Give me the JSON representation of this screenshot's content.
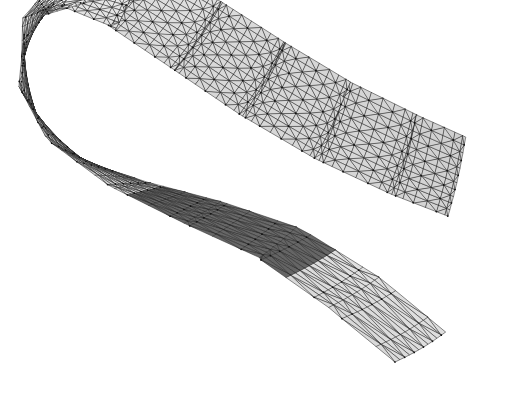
{
  "figure": {
    "kind": "3d-surface-mesh",
    "background_color": "#ffffff",
    "canvas": {
      "width": 525,
      "height": 394
    }
  },
  "render": {
    "mesh_edge_color": "#2b2b2b",
    "mesh_edge_width": 0.55,
    "vertex_dot_color": "#111111",
    "vertex_dot_radius": 0.85,
    "show_vertex_dots": true,
    "shading_model": "lambert-flat",
    "light_direction": [
      -0.35,
      -0.55,
      0.76
    ],
    "ambient": 0.42,
    "diffuse": 0.58,
    "face_fill_light": "#e8e8e8",
    "face_fill_mid": "#c2c2c2",
    "face_fill_dark": "#8f8f8f",
    "fold_fill_dark": "#585858",
    "fold_fill_darker": "#3f3f3f",
    "backface_darken": 0.46
  },
  "chart_data": {
    "type": "surface-mesh",
    "title": "Folded ribbon surface",
    "xlabel": "",
    "ylabel": "",
    "grid": false,
    "legend": "none",
    "mesh": {
      "u_divisions": 96,
      "v_divisions": 11,
      "triangulation": "alternating-diagonal",
      "u_range": [
        0,
        1
      ],
      "v_range": [
        -0.5,
        0.5
      ]
    },
    "spine_keypoints": [
      {
        "u": 0.0,
        "x": 470,
        "y": 205,
        "z": 42,
        "width": 74,
        "twist": 14,
        "tilt": -26
      },
      {
        "u": 0.07,
        "x": 420,
        "y": 188,
        "z": 50,
        "width": 78,
        "twist": 10,
        "tilt": -22
      },
      {
        "u": 0.16,
        "x": 352,
        "y": 160,
        "z": 60,
        "width": 82,
        "twist": 4,
        "tilt": -16
      },
      {
        "u": 0.26,
        "x": 286,
        "y": 126,
        "z": 72,
        "width": 86,
        "twist": -2,
        "tilt": -10
      },
      {
        "u": 0.36,
        "x": 224,
        "y": 90,
        "z": 84,
        "width": 88,
        "twist": -8,
        "tilt": -4
      },
      {
        "u": 0.46,
        "x": 160,
        "y": 54,
        "z": 92,
        "width": 88,
        "twist": -16,
        "tilt": 2
      },
      {
        "u": 0.55,
        "x": 104,
        "y": 40,
        "z": 90,
        "width": 86,
        "twist": -30,
        "tilt": 10
      },
      {
        "u": 0.62,
        "x": 64,
        "y": 62,
        "z": 82,
        "width": 84,
        "twist": -48,
        "tilt": 22
      },
      {
        "u": 0.68,
        "x": 44,
        "y": 102,
        "z": 70,
        "width": 82,
        "twist": -70,
        "tilt": 36
      },
      {
        "u": 0.74,
        "x": 50,
        "y": 146,
        "z": 56,
        "width": 82,
        "twist": -92,
        "tilt": 48
      },
      {
        "u": 0.79,
        "x": 84,
        "y": 180,
        "z": 44,
        "width": 84,
        "twist": -112,
        "tilt": 54
      },
      {
        "u": 0.84,
        "x": 142,
        "y": 206,
        "z": 34,
        "width": 86,
        "twist": -126,
        "tilt": 52
      },
      {
        "u": 0.89,
        "x": 212,
        "y": 228,
        "z": 24,
        "width": 86,
        "twist": -136,
        "tilt": 44
      },
      {
        "u": 0.93,
        "x": 284,
        "y": 252,
        "z": 14,
        "width": 84,
        "twist": -142,
        "tilt": 34
      },
      {
        "u": 0.97,
        "x": 356,
        "y": 296,
        "z": 4,
        "width": 80,
        "twist": -148,
        "tilt": 22
      },
      {
        "u": 1.0,
        "x": 420,
        "y": 346,
        "z": -4,
        "width": 74,
        "twist": -152,
        "tilt": 12
      }
    ],
    "fold_region": {
      "u_start": 0.855,
      "u_end": 0.945,
      "fill": "#585858",
      "note": "inner dark tongue where the ribbon doubles back beneath itself"
    },
    "projection": {
      "type": "oblique-parallel",
      "z_shift_x": -0.3,
      "z_shift_y": -0.62,
      "scale": 1.0
    },
    "bounds": {
      "x_min": 8,
      "x_max": 508,
      "y_min": 8,
      "y_max": 382
    }
  },
  "annotations": {
    "labels": [],
    "axes_visible": false,
    "colorbar_visible": false,
    "text_present": false
  }
}
